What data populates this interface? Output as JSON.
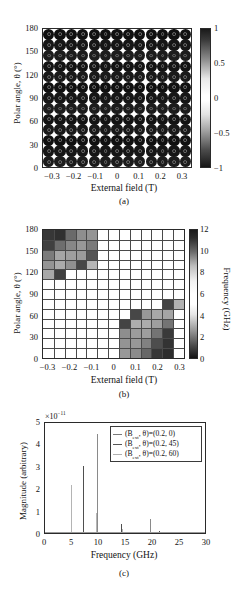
{
  "figure": {
    "panels": [
      "a",
      "b",
      "c"
    ]
  },
  "panel_a": {
    "caption": "(a)",
    "xlabel": "External field (T)",
    "ylabel": "Polar angle, θ (°)",
    "xticks": [
      "−0.3",
      "−0.2",
      "−0.1",
      "0",
      "0.1",
      "0.2",
      "0.3"
    ],
    "xtick_values": [
      -0.3,
      -0.2,
      -0.1,
      0,
      0.1,
      0.2,
      0.3
    ],
    "yticks": [
      "180",
      "150",
      "120",
      "90",
      "60",
      "30",
      "0"
    ],
    "ytick_values": [
      180,
      150,
      120,
      90,
      60,
      30,
      0
    ],
    "colorbar": {
      "ticks": [
        "1",
        "0.5",
        "0",
        "−0.5",
        "−1"
      ],
      "tick_values": [
        1,
        0.5,
        0,
        -0.5,
        -1
      ]
    },
    "grid": {
      "cols": 13,
      "rows": 13
    }
  },
  "panel_b": {
    "caption": "(b)",
    "xlabel": "External field (T)",
    "ylabel": "Polar angle, θ (°)",
    "xticks": [
      "−0.3",
      "−0.2",
      "−0.1",
      "0",
      "0.1",
      "0.2",
      "0.3"
    ],
    "xtick_values": [
      -0.3,
      -0.2,
      -0.1,
      0,
      0.1,
      0.2,
      0.3
    ],
    "yticks": [
      "180",
      "150",
      "120",
      "90",
      "60",
      "30",
      "0"
    ],
    "ytick_values": [
      180,
      150,
      120,
      90,
      60,
      30,
      0
    ],
    "colorbar": {
      "label": "Frequency (GHz)",
      "ticks": [
        "12",
        "10",
        "8",
        "6",
        "4",
        "2",
        "0"
      ],
      "tick_values": [
        12,
        10,
        8,
        6,
        4,
        2,
        0
      ]
    }
  },
  "panel_c": {
    "caption": "(c)",
    "xlabel": "Frequency (GHz)",
    "ylabel": "Magnitude (arbitrary)",
    "exponent_note": "×10",
    "exponent_power": "−11",
    "xticks": [
      "0",
      "5",
      "10",
      "15",
      "20",
      "25",
      "30"
    ],
    "xtick_values": [
      0,
      5,
      10,
      15,
      20,
      25,
      30
    ],
    "yticks": [
      "5",
      "4",
      "3",
      "2",
      "1",
      "0"
    ],
    "ytick_values": [
      5,
      4,
      3,
      2,
      1,
      0
    ],
    "legend": {
      "entries": [
        {
          "prefix": "(B",
          "sub": "ext",
          "mid": ", θ)=(0.2, 0)"
        },
        {
          "prefix": "(B",
          "sub": "ext",
          "mid": ", θ)=(0.2, 45)"
        },
        {
          "prefix": "(B",
          "sub": "ext",
          "mid": ", θ)=(0.2, 60)"
        }
      ]
    }
  },
  "chart_data": [
    {
      "type": "heatmap",
      "panel": "a",
      "title": "",
      "xlabel": "External field (T)",
      "ylabel": "Polar angle, θ (°)",
      "xlim": [
        -0.35,
        0.35
      ],
      "ylim": [
        -7.5,
        187.5
      ],
      "x": [
        -0.3,
        -0.25,
        -0.2,
        -0.15,
        -0.1,
        -0.05,
        0,
        0.05,
        0.1,
        0.15,
        0.2,
        0.25,
        0.3
      ],
      "y": [
        0,
        15,
        30,
        45,
        60,
        75,
        90,
        105,
        120,
        135,
        150,
        165,
        180
      ],
      "colorbar_label": "",
      "clim": [
        -1,
        1
      ],
      "note": "Dense grid of dark circular markers (near-saturated magnetization, values close to ±1) at every field/angle point; colour scale dark at both ±1 extremes, white near 0.",
      "values_note": "All markers render dark (|value| ≈ 1); no white cells present."
    },
    {
      "type": "heatmap",
      "panel": "b",
      "title": "",
      "xlabel": "External field (T)",
      "ylabel": "Polar angle, θ (°)",
      "colorbar_label": "Frequency (GHz)",
      "xlim": [
        -0.35,
        0.35
      ],
      "ylim": [
        -7.5,
        187.5
      ],
      "clim": [
        0,
        13
      ],
      "x": [
        -0.3,
        -0.25,
        -0.2,
        -0.15,
        -0.1,
        -0.05,
        0,
        0.05,
        0.1,
        0.15,
        0.2,
        0.25,
        0.3
      ],
      "y": [
        180,
        165,
        150,
        135,
        120,
        105,
        90,
        75,
        60,
        45,
        30,
        15,
        0
      ],
      "z": [
        [
          12.4,
          12.8,
          9.2,
          7.0,
          6.6,
          0,
          0,
          0,
          0,
          0,
          0,
          0,
          0
        ],
        [
          11.8,
          9.0,
          7.4,
          6.4,
          8.2,
          0,
          0,
          0,
          0,
          0,
          0,
          0,
          0
        ],
        [
          8.2,
          5.6,
          6.0,
          6.2,
          10.6,
          0,
          0,
          0,
          0,
          0,
          0,
          0,
          0
        ],
        [
          6.6,
          5.2,
          6.8,
          11.4,
          4.6,
          0,
          0,
          0,
          0,
          0,
          0,
          0,
          0
        ],
        [
          5.4,
          11.8,
          0,
          0,
          0,
          0,
          0,
          0,
          0,
          0,
          0,
          0,
          0
        ],
        [
          0,
          0,
          0,
          0,
          0,
          0,
          0,
          0,
          0,
          0,
          0,
          0,
          0
        ],
        [
          0,
          0,
          0,
          0,
          0,
          0,
          0,
          0,
          0,
          0,
          0,
          0,
          0
        ],
        [
          0,
          0,
          0,
          0,
          0,
          0,
          0,
          0,
          0,
          0,
          0,
          11.6,
          4.8
        ],
        [
          0,
          0,
          0,
          0,
          0,
          0,
          0,
          0,
          11.4,
          6.4,
          5.4,
          5.6,
          0
        ],
        [
          0,
          0,
          0,
          0,
          0,
          0,
          0,
          11.6,
          5.0,
          5.2,
          6.0,
          8.6,
          0
        ],
        [
          0,
          0,
          0,
          0,
          0,
          0,
          0,
          7.0,
          6.2,
          6.0,
          8.6,
          12.2,
          0
        ],
        [
          0,
          0,
          0,
          0,
          0,
          0,
          0,
          6.6,
          6.4,
          7.8,
          11.0,
          12.6,
          0
        ],
        [
          0,
          0,
          0,
          0,
          0,
          0,
          0,
          6.4,
          7.2,
          9.4,
          12.4,
          13.0,
          0
        ]
      ],
      "note": "Two anti-diagonal clusters of coloured cells: upper-left (negative field, high angle) and lower-right (positive field, low angle); rest of grid is white/zero."
    },
    {
      "type": "line",
      "panel": "c",
      "title": "",
      "xlabel": "Frequency (GHz)",
      "ylabel": "Magnitude (arbitrary)",
      "y_multiplier": "×10⁻¹¹",
      "xlim": [
        0,
        30
      ],
      "ylim": [
        0,
        5
      ],
      "grid": false,
      "legend_position": "upper right",
      "series": [
        {
          "name": "(B_ext, θ)=(0.2, 0)",
          "peaks": [
            {
              "x": 9.8,
              "y": 4.5
            },
            {
              "x": 19.7,
              "y": 0.62
            }
          ]
        },
        {
          "name": "(B_ext, θ)=(0.2, 45)",
          "peaks": [
            {
              "x": 7.1,
              "y": 3.05
            },
            {
              "x": 14.2,
              "y": 0.42
            },
            {
              "x": 21.3,
              "y": 0.1
            }
          ]
        },
        {
          "name": "(B_ext, θ)=(0.2, 60)",
          "peaks": [
            {
              "x": 4.8,
              "y": 2.2
            },
            {
              "x": 9.6,
              "y": 0.9
            },
            {
              "x": 14.4,
              "y": 0.2
            },
            {
              "x": 24.8,
              "y": 0.06
            }
          ]
        }
      ]
    }
  ]
}
